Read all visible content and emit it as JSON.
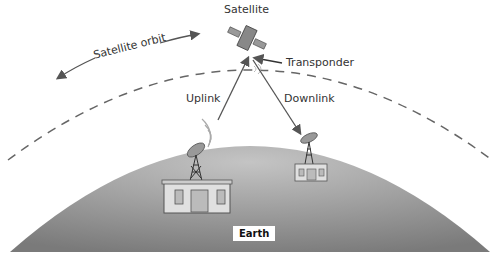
{
  "labels": {
    "satellite": "Satellite",
    "satellite_orbit": "Satellite orbit",
    "transponder": "Transponder",
    "uplink": "Uplink",
    "downlink": "Downlink",
    "earth": "Earth"
  },
  "colors": {
    "earth_light": "#bdbdbd",
    "earth_dark": "#7c7c7c",
    "line": "#555555",
    "building": "#e0e0e0"
  }
}
